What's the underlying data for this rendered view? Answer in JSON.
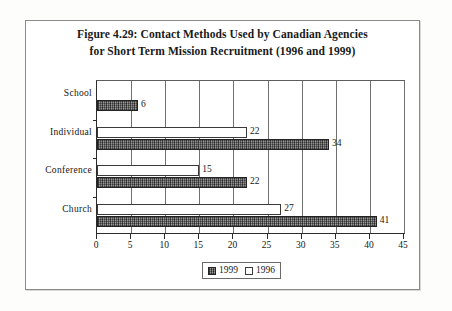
{
  "figure": {
    "title_line1": "Figure 4.29: Contact Methods Used by Canadian Agencies",
    "title_line2": "for Short Term Mission Recruitment (1996 and 1999)"
  },
  "chart_data": {
    "type": "bar",
    "orientation": "horizontal",
    "title": "Figure 4.29: Contact Methods Used by Canadian Agencies for Short Term Mission Recruitment (1996 and 1999)",
    "xlabel": "",
    "ylabel": "",
    "categories": [
      "School",
      "Individual",
      "Conference",
      "Church"
    ],
    "series": [
      {
        "name": "1999",
        "values": [
          6,
          34,
          22,
          41
        ],
        "color": "#6e6e6e"
      },
      {
        "name": "1996",
        "values": [
          null,
          22,
          15,
          27
        ],
        "color": "#ffffff"
      }
    ],
    "xlim": [
      0,
      45
    ],
    "xticks": [
      0,
      5,
      10,
      15,
      20,
      25,
      30,
      35,
      40,
      45
    ],
    "grid": true,
    "legend_position": "bottom",
    "bar_labels": {
      "School": {
        "1999": "6",
        "1996": ""
      },
      "Individual": {
        "1999": "34",
        "1996": "22"
      },
      "Conference": {
        "1999": "22",
        "1996": "15"
      },
      "Church": {
        "1999": "41",
        "1996": "27"
      }
    }
  },
  "legend": {
    "items": [
      {
        "label": "1999",
        "style": "dark"
      },
      {
        "label": "1996",
        "style": "light"
      }
    ]
  }
}
